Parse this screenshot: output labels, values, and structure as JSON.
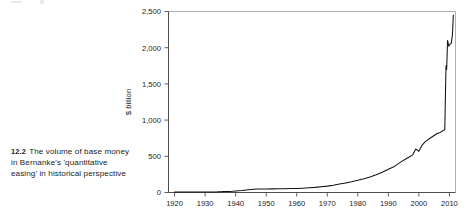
{
  "figure": {
    "caption_number": "12.2",
    "caption_text": "The volume of base money in Bernanke's 'quantitative easing' in historical perspective"
  },
  "chart_data": {
    "type": "line",
    "title": "",
    "xlabel": "",
    "ylabel": "$ billion",
    "xlim": [
      1918,
      2012
    ],
    "ylim": [
      0,
      2500
    ],
    "grid": false,
    "legend": "none",
    "xticks": [
      "1920",
      "1930",
      "1940",
      "1950",
      "1960",
      "1970",
      "1980",
      "1990",
      "2000",
      "2010"
    ],
    "xtick_values": [
      1920,
      1930,
      1940,
      1950,
      1960,
      1970,
      1980,
      1990,
      2000,
      2010
    ],
    "yticks": [
      "0",
      "500",
      "1,000",
      "1,500",
      "2,000",
      "2,500"
    ],
    "ytick_values": [
      0,
      500,
      1000,
      1500,
      2000,
      2500
    ],
    "series": [
      {
        "name": "US monetary base",
        "color": "#111111",
        "x": [
          1920,
          1922,
          1924,
          1926,
          1928,
          1930,
          1932,
          1934,
          1935,
          1936,
          1937,
          1938,
          1939,
          1940,
          1941,
          1942,
          1943,
          1944,
          1945,
          1946,
          1947,
          1948,
          1949,
          1950,
          1952,
          1954,
          1956,
          1958,
          1960,
          1962,
          1964,
          1966,
          1968,
          1970,
          1972,
          1974,
          1976,
          1978,
          1980,
          1982,
          1984,
          1986,
          1988,
          1990,
          1992,
          1994,
          1996,
          1998,
          1999,
          2000,
          2001,
          2002,
          2004,
          2006,
          2007,
          2008.5,
          2008.75,
          2008.9,
          2009.1,
          2009.4,
          2009.8,
          2010.2,
          2010.6,
          2011.0,
          2011.3
        ],
        "y": [
          6,
          6,
          6,
          6,
          6,
          6,
          7,
          9,
          11,
          13,
          14,
          15,
          17,
          20,
          23,
          27,
          32,
          37,
          42,
          46,
          47,
          48,
          47,
          48,
          50,
          52,
          53,
          54,
          56,
          60,
          65,
          71,
          79,
          88,
          100,
          116,
          132,
          148,
          168,
          190,
          215,
          245,
          280,
          320,
          360,
          420,
          470,
          520,
          600,
          570,
          650,
          700,
          760,
          815,
          830,
          870,
          1450,
          1750,
          1700,
          2100,
          2020,
          2050,
          2060,
          2180,
          2450
        ],
        "annotations": [
          {
            "label": "Y2K liquidity bump",
            "x": 1999,
            "y": 600
          },
          {
            "label": "QE1 onset",
            "x": 2008.75,
            "y": 1450
          },
          {
            "label": "QE2 peak",
            "x": 2011.3,
            "y": 2450
          }
        ]
      }
    ]
  }
}
